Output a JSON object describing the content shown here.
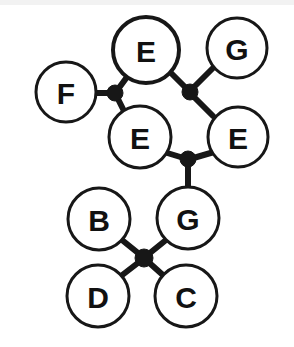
{
  "diagram": {
    "background_color": "#ffffff",
    "stroke_color": "#171717",
    "label_color": "#111111",
    "node_fill": "#ffffff",
    "top_band_color": "#f2f2f2",
    "canvas": {
      "width": 294,
      "height": 347
    },
    "nodes": [
      {
        "id": "n-e-top",
        "label": "E",
        "cx": 146,
        "cy": 50,
        "r": 33,
        "stroke_width": 4,
        "font_size": 33
      },
      {
        "id": "n-g-top",
        "label": "G",
        "cx": 237,
        "cy": 48,
        "r": 30,
        "stroke_width": 3,
        "font_size": 31
      },
      {
        "id": "n-f",
        "label": "F",
        "cx": 66,
        "cy": 92,
        "r": 30,
        "stroke_width": 3,
        "font_size": 31
      },
      {
        "id": "n-e-mid",
        "label": "E",
        "cx": 140,
        "cy": 137,
        "r": 31,
        "stroke_width": 3,
        "font_size": 31
      },
      {
        "id": "n-e-right",
        "label": "E",
        "cx": 238,
        "cy": 137,
        "r": 30,
        "stroke_width": 3,
        "font_size": 31
      },
      {
        "id": "n-b",
        "label": "B",
        "cx": 99,
        "cy": 219,
        "r": 31,
        "stroke_width": 3,
        "font_size": 31
      },
      {
        "id": "n-g-bottom",
        "label": "G",
        "cx": 188,
        "cy": 218,
        "r": 31,
        "stroke_width": 3,
        "font_size": 31
      },
      {
        "id": "n-d",
        "label": "D",
        "cx": 98,
        "cy": 296,
        "r": 31,
        "stroke_width": 3,
        "font_size": 31
      },
      {
        "id": "n-c",
        "label": "C",
        "cx": 186,
        "cy": 296,
        "r": 31,
        "stroke_width": 3,
        "font_size": 31
      }
    ],
    "junctions": [
      {
        "id": "j-left",
        "cx": 115,
        "cy": 93,
        "r": 8
      },
      {
        "id": "j-upper",
        "cx": 190,
        "cy": 92,
        "r": 8
      },
      {
        "id": "j-middle",
        "cx": 188,
        "cy": 159,
        "r": 8
      },
      {
        "id": "j-cross",
        "cx": 144,
        "cy": 258,
        "r": 9
      }
    ],
    "edges": [
      {
        "id": "edge-f-jleft",
        "from": "n-f",
        "to": "j-left",
        "x1": 96,
        "y1": 93,
        "x2": 116,
        "y2": 93,
        "width": 6
      },
      {
        "id": "edge-etop-jleft",
        "from": "n-e-top",
        "to": "j-left",
        "x1": 127,
        "y1": 77,
        "x2": 116,
        "y2": 92,
        "width": 6
      },
      {
        "id": "edge-emid-jleft",
        "from": "n-e-mid",
        "to": "j-left",
        "x1": 124,
        "y1": 111,
        "x2": 116,
        "y2": 95,
        "width": 6
      },
      {
        "id": "edge-etop-jupper",
        "from": "n-e-top",
        "to": "j-upper",
        "x1": 170,
        "y1": 72,
        "x2": 189,
        "y2": 91,
        "width": 6
      },
      {
        "id": "edge-gtop-jupper",
        "from": "n-g-top",
        "to": "j-upper",
        "x1": 213,
        "y1": 68,
        "x2": 191,
        "y2": 90,
        "width": 6
      },
      {
        "id": "edge-eright-jupper",
        "from": "n-e-right",
        "to": "j-upper",
        "x1": 213,
        "y1": 116,
        "x2": 191,
        "y2": 94,
        "width": 6
      },
      {
        "id": "edge-emid-jmiddle",
        "from": "n-e-mid",
        "to": "j-middle",
        "x1": 164,
        "y1": 152,
        "x2": 187,
        "y2": 159,
        "width": 6
      },
      {
        "id": "edge-eright-jmiddle",
        "from": "n-e-right",
        "to": "j-middle",
        "x1": 214,
        "y1": 152,
        "x2": 190,
        "y2": 159,
        "width": 6
      },
      {
        "id": "edge-gbot-jmiddle",
        "from": "n-g-bottom",
        "to": "j-middle",
        "x1": 188,
        "y1": 188,
        "x2": 188,
        "y2": 160,
        "width": 6
      },
      {
        "id": "edge-b-jcross",
        "from": "n-b",
        "to": "j-cross",
        "x1": 122,
        "y1": 240,
        "x2": 143,
        "y2": 257,
        "width": 6
      },
      {
        "id": "edge-gbot-jcross",
        "from": "n-g-bottom",
        "to": "j-cross",
        "x1": 166,
        "y1": 240,
        "x2": 145,
        "y2": 257,
        "width": 6
      },
      {
        "id": "edge-d-jcross",
        "from": "n-d",
        "to": "j-cross",
        "x1": 121,
        "y1": 276,
        "x2": 143,
        "y2": 259,
        "width": 6
      },
      {
        "id": "edge-c-jcross",
        "from": "n-c",
        "to": "j-cross",
        "x1": 164,
        "y1": 276,
        "x2": 145,
        "y2": 259,
        "width": 6
      }
    ]
  }
}
